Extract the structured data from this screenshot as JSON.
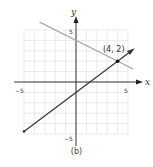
{
  "chart_data": {
    "type": "line",
    "title": "",
    "caption": "(b)",
    "xlabel": "x",
    "ylabel": "y",
    "xlim": [
      -5,
      5
    ],
    "ylim": [
      -5,
      5
    ],
    "grid": true,
    "x_ticks": [
      {
        "value": -5,
        "label": "−5"
      },
      {
        "value": 5,
        "label": "5"
      }
    ],
    "y_ticks": [
      {
        "value": 5,
        "label": "5"
      },
      {
        "value": -5,
        "label": "−5"
      }
    ],
    "series": [
      {
        "name": "dark line",
        "color": "#3a3a3a",
        "equation": "y = 0.75x - 1",
        "points": [
          [
            -5,
            -4.75
          ],
          [
            5.5,
            3.125
          ]
        ],
        "arrows": "both"
      },
      {
        "name": "gray line",
        "color": "#a8a8a8",
        "equation": "y = -0.5x + 4",
        "points": [
          [
            -3.5,
            5.75
          ],
          [
            5.5,
            1.25
          ]
        ],
        "arrows": "none"
      }
    ],
    "annotations": [
      {
        "label": "(4, 2)",
        "point": [
          4,
          2
        ]
      }
    ]
  },
  "labels": {
    "x_axis": "x",
    "y_axis": "y",
    "tick_x_neg": "−5",
    "tick_x_pos": "5",
    "tick_y_pos": "5",
    "tick_y_neg": "−5",
    "point_label": "(4, 2)",
    "caption": "(b)"
  }
}
